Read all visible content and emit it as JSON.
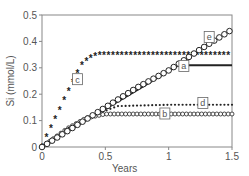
{
  "chart_data": {
    "type": "line",
    "title": "",
    "xlabel": "Years",
    "ylabel": "Si (mmol/L)",
    "xlim": [
      0,
      1.5
    ],
    "ylim": [
      0,
      0.5
    ],
    "xticks": [
      0,
      0.5,
      1,
      1.5
    ],
    "xtick_labels": [
      "0",
      "0.5",
      "1",
      "1.5"
    ],
    "yticks": [
      0,
      0.1,
      0.2,
      0.3,
      0.4,
      0.5
    ],
    "ytick_labels": [
      "0",
      "0.1",
      "0.2",
      "0.3",
      "0.4",
      "0.5"
    ],
    "grid": false,
    "series": [
      {
        "name": "a",
        "marker": "line",
        "x": [
          0,
          1.08,
          1.5
        ],
        "values": [
          0,
          0.31,
          0.31
        ],
        "label_at": [
          1.12,
          0.305
        ]
      },
      {
        "name": "b",
        "marker": "small-circle",
        "x": [
          0,
          0.2,
          0.35,
          0.5,
          1.0,
          1.5
        ],
        "values": [
          0,
          0.07,
          0.11,
          0.125,
          0.125,
          0.125
        ],
        "label_at": [
          0.97,
          0.125
        ]
      },
      {
        "name": "c",
        "marker": "asterisk",
        "x": [
          0,
          0.05,
          0.1,
          0.15,
          0.2,
          0.25,
          0.3,
          0.35,
          0.4,
          0.45,
          0.5,
          1.0,
          1.5
        ],
        "values": [
          0,
          0.05,
          0.1,
          0.15,
          0.2,
          0.25,
          0.3,
          0.325,
          0.34,
          0.345,
          0.345,
          0.345,
          0.345
        ],
        "label_at": [
          0.28,
          0.255
        ]
      },
      {
        "name": "d",
        "marker": "dot",
        "x": [
          0,
          0.2,
          0.4,
          0.6,
          1.0,
          1.5
        ],
        "values": [
          0,
          0.07,
          0.12,
          0.155,
          0.16,
          0.16
        ],
        "label_at": [
          1.27,
          0.165
        ]
      },
      {
        "name": "e",
        "marker": "open-circle",
        "x": [
          0,
          0.25,
          0.5,
          0.75,
          1.0,
          1.25,
          1.5
        ],
        "values": [
          0,
          0.075,
          0.15,
          0.225,
          0.29,
          0.37,
          0.445
        ],
        "label_at": [
          1.32,
          0.415
        ]
      }
    ]
  },
  "colors": {
    "axis": "#888888",
    "series": "#222222",
    "text": "#555555"
  }
}
